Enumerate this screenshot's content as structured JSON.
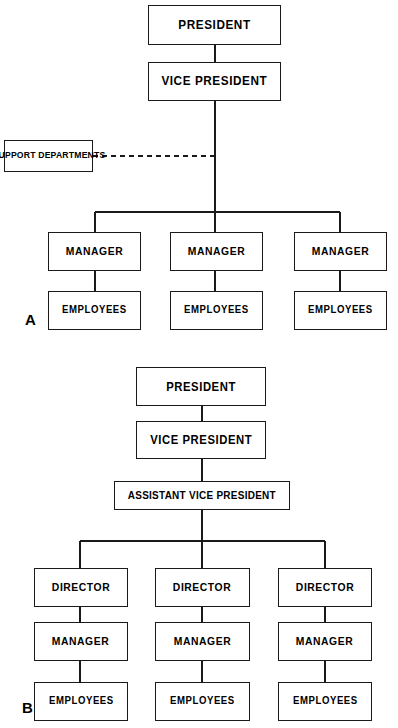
{
  "document": {
    "title": "Organizational Structure Charts",
    "background_color": "#ffffff",
    "line_color": "#1a1a1a",
    "text_color": "#000000"
  },
  "charts": [
    {
      "tag": "A",
      "description": "Flat organizational structure with support departments",
      "nodes": {
        "president": "PRESIDENT",
        "vice_president": "VICE PRESIDENT",
        "support_departments": "SUPPORT DEPARTMENTS",
        "manager_1": "MANAGER",
        "manager_2": "MANAGER",
        "manager_3": "MANAGER",
        "employees_1": "EMPLOYEES",
        "employees_2": "EMPLOYEES",
        "employees_3": "EMPLOYEES"
      }
    },
    {
      "tag": "B",
      "description": "Tall organizational structure with assistant vice president and directors",
      "nodes": {
        "president": "PRESIDENT",
        "vice_president": "VICE PRESIDENT",
        "assistant_vice_president": "ASSISTANT VICE PRESIDENT",
        "director_1": "DIRECTOR",
        "director_2": "DIRECTOR",
        "director_3": "DIRECTOR",
        "manager_1": "MANAGER",
        "manager_2": "MANAGER",
        "manager_3": "MANAGER",
        "employees_1": "EMPLOYEES",
        "employees_2": "EMPLOYEES",
        "employees_3": "EMPLOYEES"
      }
    }
  ]
}
